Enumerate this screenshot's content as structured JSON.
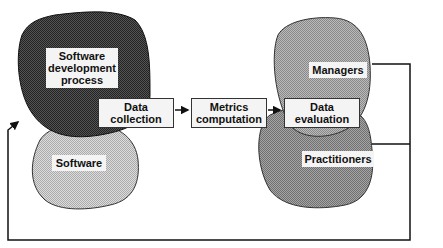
{
  "blobs": {
    "software_process": "Software development process",
    "software": "Software",
    "managers": "Managers",
    "practitioners": "Practitioners"
  },
  "boxes": {
    "collection": "Data collection",
    "metrics": "Metrics computation",
    "evaluation": "Data evaluation"
  },
  "colors": {
    "dark_blob": "#3a3a3a",
    "light_blob": "#c8c8c8",
    "mid_blob": "#a8a8a8",
    "mid_blob2": "#8c8c8c"
  }
}
